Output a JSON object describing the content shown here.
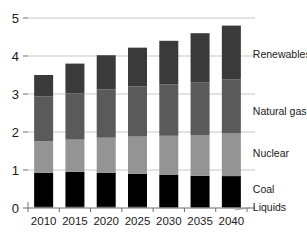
{
  "chart_data": {
    "type": "bar",
    "stacked": true,
    "title": "",
    "xlabel": "",
    "ylabel": "",
    "categories": [
      "2010",
      "2015",
      "2020",
      "2025",
      "2030",
      "2035",
      "2040"
    ],
    "ylim": [
      0,
      5
    ],
    "yticks": [
      0,
      1,
      2,
      3,
      4,
      5
    ],
    "ytick_labels": [
      "0",
      "1",
      "2",
      "3",
      "4",
      "5"
    ],
    "grid": true,
    "legend_position": "right-inline",
    "series": [
      {
        "name": "Liquids",
        "color": "#7d7d7d",
        "values": [
          0.03,
          0.03,
          0.03,
          0.03,
          0.02,
          0.02,
          0.02
        ]
      },
      {
        "name": "Coal",
        "color": "#000000",
        "values": [
          0.9,
          0.92,
          0.9,
          0.87,
          0.85,
          0.83,
          0.82
        ]
      },
      {
        "name": "Nuclear",
        "color": "#949494",
        "values": [
          0.83,
          0.85,
          0.92,
          0.98,
          1.03,
          1.07,
          1.12
        ]
      },
      {
        "name": "Natural gas",
        "color": "#5a5a5a",
        "values": [
          1.18,
          1.22,
          1.27,
          1.32,
          1.35,
          1.38,
          1.42
        ]
      },
      {
        "name": "Renewables",
        "color": "#3a3a3a",
        "values": [
          0.56,
          0.78,
          0.9,
          1.02,
          1.15,
          1.3,
          1.42
        ]
      }
    ],
    "totals": [
      3.5,
      3.8,
      4.02,
      4.22,
      4.4,
      4.6,
      4.8
    ]
  },
  "legend": {
    "entries": [
      {
        "label": "Renewables",
        "at_value": 4.05
      },
      {
        "label": "Natural gas",
        "at_value": 2.55
      },
      {
        "label": "Nuclear",
        "at_value": 1.45
      },
      {
        "label": "Coal",
        "at_value": 0.5
      },
      {
        "label": "Liquids",
        "at_value": 0.02
      }
    ]
  }
}
